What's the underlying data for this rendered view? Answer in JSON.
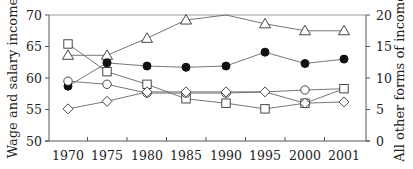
{
  "chart_data": {
    "type": "line",
    "title": "",
    "xlabel": "",
    "ylabel": "Wage and salary income",
    "ylabel_right": "All other forms of income",
    "categories": [
      "1970",
      "1975",
      "1980",
      "1985",
      "1990",
      "1995",
      "2000",
      "2001"
    ],
    "ylim": [
      50,
      70
    ],
    "ylim_right": [
      0,
      20
    ],
    "yticks": [
      50,
      55,
      60,
      65,
      70
    ],
    "yticks_right": [
      0,
      5,
      10,
      15,
      20
    ],
    "grid": false,
    "legend": "none",
    "series": [
      {
        "name": "triangle",
        "marker": "open-triangle",
        "axis": "left",
        "values": [
          63.6,
          63.6,
          66.3,
          69.2,
          70.0,
          68.6,
          67.5,
          67.5
        ],
        "show_marker": [
          true,
          true,
          true,
          true,
          false,
          true,
          true,
          true
        ]
      },
      {
        "name": "filled-circle",
        "marker": "filled-circle",
        "axis": "left",
        "values": [
          58.7,
          62.4,
          61.9,
          61.7,
          61.9,
          64.1,
          62.3,
          63.0
        ],
        "show_marker": [
          true,
          true,
          true,
          true,
          true,
          true,
          true,
          true
        ]
      },
      {
        "name": "square",
        "marker": "open-square",
        "axis": "left",
        "values": [
          65.4,
          61.0,
          59.0,
          56.7,
          56.0,
          55.1,
          56.0,
          58.3
        ],
        "show_marker": [
          true,
          true,
          true,
          true,
          true,
          true,
          true,
          true
        ]
      },
      {
        "name": "open-circle",
        "marker": "open-circle",
        "axis": "left",
        "values": [
          59.5,
          59.0,
          57.6,
          57.6,
          57.6,
          57.8,
          58.1,
          58.3
        ],
        "show_marker": [
          true,
          true,
          true,
          true,
          true,
          false,
          true,
          false
        ]
      },
      {
        "name": "diamond",
        "marker": "open-diamond",
        "axis": "left",
        "values": [
          55.1,
          56.3,
          57.8,
          57.8,
          57.8,
          57.8,
          56.0,
          56.2
        ],
        "show_marker": [
          true,
          true,
          true,
          true,
          true,
          true,
          true,
          true
        ]
      }
    ]
  },
  "labels": {
    "ylabel_left": "Wage and salary income",
    "ylabel_right": "All other forms of income"
  }
}
